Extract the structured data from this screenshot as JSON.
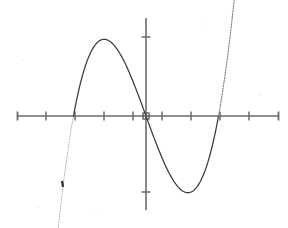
{
  "figure": {
    "title": "",
    "background_color": "#ffffff",
    "width": 288,
    "height": 228
  },
  "axes": {
    "x_axis": {
      "name": "x-axis",
      "color": "#6b6b6b",
      "pixel_y": 116,
      "pixel_x_start": 17,
      "pixel_x_end": 278,
      "tick_count": 10,
      "tick_spacing_px": 29,
      "tick_length_px": 9,
      "tick_positions_px": [
        17,
        46,
        75,
        104,
        133,
        162,
        191,
        220,
        249,
        278
      ],
      "label": "",
      "tick_labels": []
    },
    "y_axis": {
      "name": "y-axis",
      "color": "#6b6b6b",
      "pixel_x": 146,
      "pixel_y_start": 18,
      "pixel_y_end": 210,
      "tick_count": 2,
      "tick_positions_px": [
        37,
        192
      ],
      "tick_length_px": 9,
      "label": "",
      "tick_labels": []
    },
    "origin_marker": {
      "name": "origin-square-marker",
      "pixel_x": 146,
      "pixel_y": 116,
      "size_px": 6,
      "color": "#4a4a4a"
    }
  },
  "chart_data": {
    "type": "line",
    "title": "",
    "subtitle": "",
    "xlabel": "",
    "ylabel": "",
    "grid": false,
    "legend": null,
    "function_form": "cubic",
    "xlim": [
      -4.45,
      4.55
    ],
    "ylim": [
      -3.38,
      3.38
    ],
    "units_per_tick_x": 1,
    "roots_x": [
      -2.5,
      0,
      2.5
    ],
    "local_maximum": {
      "x": -1.44,
      "y": 2.7
    },
    "local_minimum": {
      "x": 1.44,
      "y": -2.21
    },
    "x": [
      -4.45,
      -4.0,
      -3.5,
      -3.0,
      -2.5,
      -2.0,
      -1.44,
      -1.0,
      -0.5,
      0.0,
      0.5,
      1.0,
      1.44,
      2.0,
      2.5,
      3.0,
      3.5,
      4.0,
      4.55
    ],
    "y": [
      -6.99,
      -5.07,
      -3.25,
      -1.8,
      0.0,
      1.38,
      2.7,
      2.47,
      1.6,
      0.0,
      -1.12,
      -2.0,
      -2.21,
      -1.66,
      0.0,
      2.03,
      4.09,
      6.3,
      8.55
    ],
    "series": [
      {
        "name": "cubic-curve",
        "color": "#3a3a3a",
        "style": "solid-center-dotted-tails",
        "line_width": 1.25
      }
    ],
    "pixel_anchors": {
      "left_root_px": [
        73,
        116
      ],
      "center_root_px": [
        146,
        116
      ],
      "right_root_px": [
        218,
        116
      ],
      "peak_px": [
        105,
        38
      ],
      "trough_px": [
        190,
        180
      ],
      "lower_left_end_px": [
        57,
        210
      ],
      "upper_right_end_px": [
        233,
        22
      ]
    }
  },
  "annotations": {
    "tail_dash_marker": {
      "name": "lower-left-tail-dash",
      "pixel_x": 62,
      "pixel_y": 184,
      "length_px": 6,
      "color": "#2f2f2f"
    }
  }
}
